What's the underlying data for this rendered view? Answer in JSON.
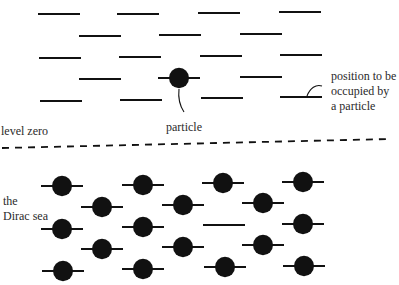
{
  "labels": {
    "particle": "particle",
    "level_zero": "level zero",
    "position_to_be_occupied": "position to be\noccupied by\na particle",
    "dirac_sea": "the\nDirac sea"
  },
  "colors": {
    "ink": "#111111",
    "background": "#ffffff"
  },
  "diagram": {
    "width": 399,
    "height": 285,
    "level_half_width": 21,
    "particle_radius": 10,
    "line_thickness": 2.2,
    "upper_region": {
      "description": "empty positive-energy levels",
      "empty_levels": [
        {
          "x": 59,
          "y": 14
        },
        {
          "x": 138,
          "y": 14
        },
        {
          "x": 219,
          "y": 13
        },
        {
          "x": 300,
          "y": 12
        },
        {
          "x": 100,
          "y": 36
        },
        {
          "x": 180,
          "y": 35
        },
        {
          "x": 261,
          "y": 34
        },
        {
          "x": 60,
          "y": 58
        },
        {
          "x": 140,
          "y": 57
        },
        {
          "x": 221,
          "y": 56
        },
        {
          "x": 301,
          "y": 55
        },
        {
          "x": 100,
          "y": 79
        },
        {
          "x": 261,
          "y": 77
        },
        {
          "x": 61,
          "y": 101
        },
        {
          "x": 141,
          "y": 100
        },
        {
          "x": 222,
          "y": 98
        },
        {
          "x": 301,
          "y": 97
        }
      ],
      "occupied_levels": [
        {
          "x": 179,
          "y": 78
        }
      ]
    },
    "zero_level": {
      "y_left": 148,
      "y_right": 139,
      "x_start": 2,
      "x_end": 390,
      "dash": 7,
      "gap": 6
    },
    "lower_region": {
      "description": "the Dirac sea of filled negative-energy states",
      "occupied_levels": [
        {
          "x": 62,
          "y": 186
        },
        {
          "x": 143,
          "y": 185
        },
        {
          "x": 223,
          "y": 183
        },
        {
          "x": 303,
          "y": 182
        },
        {
          "x": 102,
          "y": 207
        },
        {
          "x": 183,
          "y": 205
        },
        {
          "x": 263,
          "y": 203
        },
        {
          "x": 62,
          "y": 229
        },
        {
          "x": 143,
          "y": 227
        },
        {
          "x": 303,
          "y": 224
        },
        {
          "x": 102,
          "y": 249
        },
        {
          "x": 183,
          "y": 247
        },
        {
          "x": 263,
          "y": 245
        },
        {
          "x": 63,
          "y": 271
        },
        {
          "x": 143,
          "y": 269
        },
        {
          "x": 225,
          "y": 267
        },
        {
          "x": 304,
          "y": 266
        }
      ],
      "empty_levels": [
        {
          "x": 224,
          "y": 225
        }
      ]
    },
    "callouts": [
      {
        "name": "particle-callout",
        "path": "M179,89 C178,98 180,106 184,112"
      },
      {
        "name": "position-callout",
        "path": "M307,96 C310,88 316,84 322,86"
      }
    ]
  }
}
